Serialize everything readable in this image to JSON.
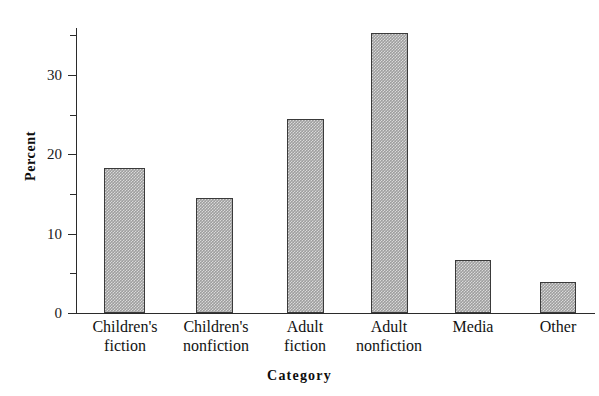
{
  "chart_data": {
    "type": "bar",
    "title": "",
    "xlabel": "Category",
    "ylabel": "Percent",
    "categories": [
      "Children's\nfiction",
      "Children's\nnonfiction",
      "Adult\nfiction",
      "Adult\nnonfiction",
      "Media",
      "Other"
    ],
    "category_lines": [
      [
        "Children's",
        "fiction"
      ],
      [
        "Children's",
        "nonfiction"
      ],
      [
        "Adult",
        "fiction"
      ],
      [
        "Adult",
        "nonfiction"
      ],
      [
        "Media",
        ""
      ],
      [
        "Other",
        ""
      ]
    ],
    "values": [
      18.3,
      14.5,
      24.5,
      35.3,
      6.7,
      3.9
    ],
    "ylim": [
      0,
      35.9
    ],
    "ytick_labels": [
      "0",
      "10",
      "20",
      "30"
    ],
    "ytick_values": [
      0,
      10,
      20,
      30
    ],
    "yminor_tick_values": [
      5,
      15,
      25,
      35
    ],
    "grid": "off",
    "legend": "none",
    "bar_fill_color": "#9e9e9e",
    "bar_edge_color": "#3a3a3a",
    "axis_color": "#2b2b2b",
    "background_color": "#ffffff"
  },
  "axis": {
    "y_title": "Percent",
    "x_title": "Category"
  }
}
